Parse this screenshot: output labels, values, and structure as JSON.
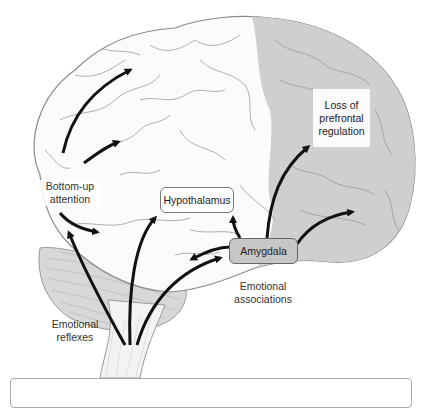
{
  "diagram": {
    "colors": {
      "brain_fill": "#fbfbfb",
      "prefrontal_fill": "#cfcfcf",
      "cerebellum_fill": "#d8d8d8",
      "outline": "#8a8a8a",
      "arrow": "#111111",
      "amygdala_fill": "#c6c6c6"
    },
    "regions": [
      {
        "name": "prefrontal cortex",
        "shading": "gray"
      },
      {
        "name": "cerebrum",
        "shading": "white"
      },
      {
        "name": "cerebellum",
        "shading": "gray striated"
      },
      {
        "name": "brainstem",
        "shading": "white"
      }
    ],
    "labels": {
      "bottom_up_line1": "Bottom-up",
      "bottom_up_line2": "attention",
      "hypothalamus": "Hypothalamus",
      "amygdala": "Amygdala",
      "prefrontal_line1": "Loss of",
      "prefrontal_line2": "prefrontal",
      "prefrontal_line3": "regulation",
      "emotional_assoc_line1": "Emotional",
      "emotional_assoc_line2": "associations",
      "emotional_reflex_line1": "Emotional",
      "emotional_reflex_line2": "reflexes"
    },
    "arrows": [
      {
        "from": "bottom-up attention",
        "to": "parietal cortex (upper)"
      },
      {
        "from": "bottom-up attention",
        "to": "parietal cortex (middle)"
      },
      {
        "from": "bottom-up attention",
        "to": "temporal cortex"
      },
      {
        "from": "brainstem",
        "to": "bottom-up attention"
      },
      {
        "from": "brainstem",
        "to": "hypothalamus"
      },
      {
        "from": "brainstem",
        "to": "amygdala"
      },
      {
        "from": "amygdala",
        "to": "hypothalamus"
      },
      {
        "from": "amygdala",
        "to": "temporal region"
      },
      {
        "from": "amygdala",
        "to": "prefrontal (loss of regulation)"
      },
      {
        "from": "amygdala",
        "to": "orbitofrontal cortex"
      }
    ]
  }
}
